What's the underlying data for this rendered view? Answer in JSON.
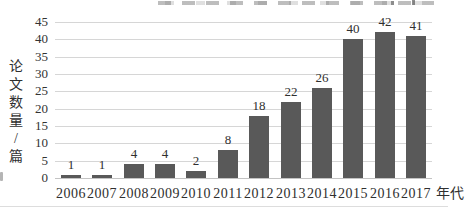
{
  "chart_data": {
    "type": "bar",
    "title": "",
    "categories": [
      "2006",
      "2007",
      "2008",
      "2009",
      "2010",
      "2011",
      "2012",
      "2013",
      "2014",
      "2015",
      "2016",
      "2017"
    ],
    "values": [
      1,
      1,
      4,
      4,
      2,
      8,
      18,
      22,
      26,
      40,
      42,
      41
    ],
    "data_labels_shown": true,
    "xlabel": "年代",
    "ylabel": "论文数量/篇",
    "ylim": [
      0,
      45
    ],
    "yticks": [
      0,
      5,
      10,
      15,
      20,
      25,
      30,
      35,
      40,
      45
    ],
    "grid": "horizontal",
    "legend": "none",
    "bar_color": "#595959",
    "gridline_color": "#d6d6d6",
    "text_color": "#2f2f2f",
    "background_color": "#ffffff"
  }
}
